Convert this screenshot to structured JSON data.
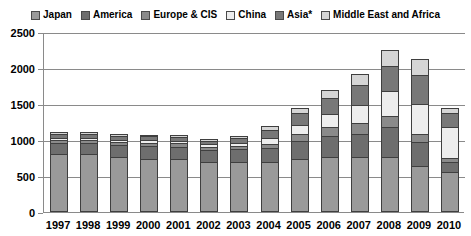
{
  "chart_data": {
    "type": "bar",
    "subtype": "stacked-column",
    "title": "",
    "xlabel": "",
    "ylabel": "",
    "ylim": [
      0,
      2500
    ],
    "yticks": [
      0,
      500,
      1000,
      1500,
      2000,
      2500
    ],
    "grid": true,
    "legend_position": "top",
    "categories": [
      "1997",
      "1998",
      "1999",
      "2000",
      "2001",
      "2002",
      "2003",
      "2004",
      "2005",
      "2006",
      "2007",
      "2008",
      "2009",
      "2010"
    ],
    "series": [
      {
        "name": "Japan",
        "color": "#9a9a9a",
        "values": [
          810,
          800,
          760,
          740,
          740,
          700,
          700,
          690,
          740,
          760,
          760,
          760,
          640,
          560
        ]
      },
      {
        "name": "America",
        "color": "#6e6e6e",
        "values": [
          150,
          160,
          170,
          180,
          170,
          160,
          170,
          200,
          250,
          300,
          330,
          420,
          330,
          130
        ]
      },
      {
        "name": "Europe & CIS",
        "color": "#8a8a8a",
        "values": [
          45,
          40,
          45,
          45,
          45,
          45,
          50,
          60,
          90,
          120,
          140,
          150,
          110,
          60
        ]
      },
      {
        "name": "China",
        "color": "#ededed",
        "values": [
          30,
          30,
          30,
          35,
          35,
          35,
          45,
          80,
          130,
          180,
          250,
          350,
          420,
          430
        ]
      },
      {
        "name": "Asia*",
        "color": "#787878",
        "values": [
          50,
          50,
          50,
          50,
          55,
          50,
          60,
          110,
          160,
          230,
          290,
          350,
          400,
          190
        ]
      },
      {
        "name": "Middle East and Africa",
        "color": "#d5d5d5",
        "values": [
          25,
          25,
          25,
          25,
          25,
          25,
          30,
          50,
          70,
          110,
          150,
          220,
          230,
          80
        ]
      }
    ],
    "totals": [
      1110,
      1105,
      1080,
      1075,
      1070,
      1015,
      1055,
      1190,
      1440,
      1700,
      1920,
      2250,
      2130,
      1450
    ]
  },
  "legend": {
    "items": [
      {
        "label": "Japan",
        "swatch": "legend-swatch-japan"
      },
      {
        "label": "America",
        "swatch": "legend-swatch-america"
      },
      {
        "label": "Europe & CIS",
        "swatch": "legend-swatch-europe-cis"
      },
      {
        "label": "China",
        "swatch": "legend-swatch-china"
      },
      {
        "label": "Asia*",
        "swatch": "legend-swatch-asia"
      },
      {
        "label": "Middle East and Africa",
        "swatch": "legend-swatch-middle-east-africa"
      }
    ]
  },
  "axes": {
    "y_tick_labels": [
      "2500",
      "2000",
      "1500",
      "1000",
      "500",
      "0"
    ],
    "x_tick_labels": [
      "1997",
      "1998",
      "1999",
      "2000",
      "2001",
      "2002",
      "2003",
      "2004",
      "2005",
      "2006",
      "2007",
      "2008",
      "2009",
      "2010"
    ]
  },
  "colors": {
    "axis": "#8a8a8a",
    "grid": "#8a8a8a",
    "outline": "#3f3f3f",
    "background": "#ffffff"
  }
}
